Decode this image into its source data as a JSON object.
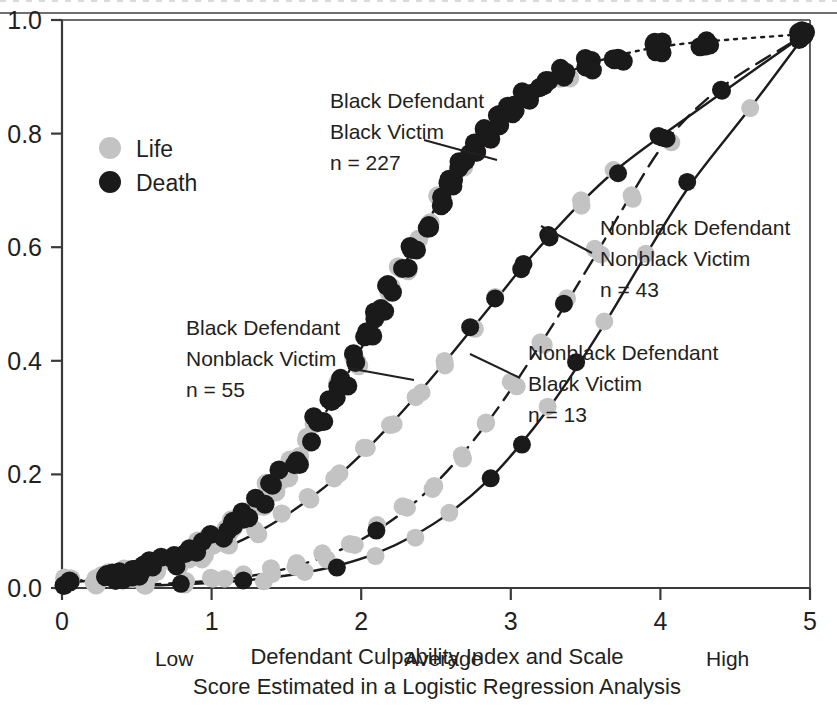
{
  "chart_data": {
    "type": "scatter",
    "title": "",
    "xlabel": "Defendant Culpability Index and Scale Score Estimated in a Logistic Regression Analysis",
    "ylabel": "",
    "xlim": [
      0,
      5
    ],
    "ylim": [
      0,
      1.0
    ],
    "grid": false,
    "x_ticks": [
      "0",
      "1",
      "2",
      "3",
      "4",
      "5"
    ],
    "x_tick_values": [
      0,
      1,
      2,
      3,
      4,
      5
    ],
    "y_ticks": [
      "0.0",
      "0.2",
      "0.4",
      "0.6",
      "0.8",
      "1.0"
    ],
    "y_tick_values": [
      0.0,
      0.2,
      0.4,
      0.6,
      0.8,
      1.0
    ],
    "x_anchor_labels": [
      {
        "label": "Low",
        "at": 0.75
      },
      {
        "label": "Average",
        "at": 2.55
      },
      {
        "label": "High",
        "at": 4.45
      }
    ],
    "legend": {
      "position": "upper-left-inside",
      "entries": [
        {
          "label": "Life",
          "marker": "circle",
          "color": "#c3c3c3"
        },
        {
          "label": "Death",
          "marker": "circle",
          "color": "#1a1a1a"
        }
      ]
    },
    "series": [
      {
        "name": "Black Defendant Black Victim",
        "n": 227,
        "n_label": "n = 227",
        "line_style": "dotted",
        "x": [
          0.05,
          0.22,
          0.3,
          0.38,
          0.45,
          0.52,
          0.6,
          0.68,
          0.76,
          0.84,
          0.92,
          1.0,
          1.08,
          1.16,
          1.24,
          1.32,
          1.4,
          1.48,
          1.56,
          1.64,
          1.72,
          1.8,
          1.88,
          1.96,
          2.04,
          2.12,
          2.2,
          2.28,
          2.36,
          2.44,
          2.52,
          2.6,
          2.68,
          2.76,
          2.84,
          2.92,
          3.0,
          3.1,
          3.22,
          3.36,
          3.52,
          3.72,
          3.98,
          4.3,
          4.95
        ],
        "y": [
          0.012,
          0.016,
          0.019,
          0.023,
          0.027,
          0.031,
          0.037,
          0.044,
          0.052,
          0.061,
          0.072,
          0.084,
          0.098,
          0.114,
          0.132,
          0.152,
          0.175,
          0.2,
          0.228,
          0.258,
          0.291,
          0.326,
          0.363,
          0.402,
          0.442,
          0.483,
          0.524,
          0.565,
          0.605,
          0.643,
          0.68,
          0.714,
          0.746,
          0.775,
          0.801,
          0.824,
          0.845,
          0.866,
          0.886,
          0.905,
          0.922,
          0.938,
          0.952,
          0.962,
          0.975
        ]
      },
      {
        "name": "Black Defendant Nonblack Victim",
        "n": 55,
        "n_label": "n = 55",
        "line_style": "dash-dot",
        "x": [
          0.05,
          0.25,
          0.45,
          0.6,
          0.78,
          0.95,
          1.12,
          1.3,
          1.48,
          1.66,
          1.84,
          2.02,
          2.2,
          2.38,
          2.56,
          2.74,
          2.92,
          3.08,
          3.26,
          3.46,
          3.7,
          4.0,
          4.95
        ],
        "y": [
          0.01,
          0.015,
          0.022,
          0.03,
          0.042,
          0.056,
          0.074,
          0.097,
          0.125,
          0.158,
          0.196,
          0.24,
          0.289,
          0.342,
          0.398,
          0.456,
          0.514,
          0.566,
          0.62,
          0.676,
          0.735,
          0.795,
          0.972
        ]
      },
      {
        "name": "Nonblack Defendant Nonblack Victim",
        "n": 43,
        "n_label": "n = 43",
        "line_style": "dashed",
        "x": [
          0.55,
          0.8,
          1.0,
          1.2,
          1.4,
          1.58,
          1.76,
          1.94,
          2.12,
          2.3,
          2.48,
          2.66,
          2.84,
          3.02,
          3.2,
          3.38,
          3.58,
          3.8,
          4.05,
          4.4,
          4.95
        ],
        "y": [
          0.006,
          0.009,
          0.013,
          0.019,
          0.028,
          0.04,
          0.056,
          0.077,
          0.104,
          0.138,
          0.18,
          0.231,
          0.29,
          0.357,
          0.43,
          0.505,
          0.592,
          0.69,
          0.79,
          0.88,
          0.972
        ]
      },
      {
        "name": "Nonblack Defendant Black Victim",
        "n": 13,
        "n_label": "n = 13",
        "line_style": "solid",
        "x": [
          0.55,
          0.85,
          1.1,
          1.35,
          1.6,
          1.85,
          2.1,
          2.35,
          2.6,
          2.85,
          3.05,
          3.25,
          3.45,
          3.65,
          3.9,
          4.2,
          4.6,
          4.95
        ],
        "y": [
          0.004,
          0.007,
          0.011,
          0.017,
          0.026,
          0.04,
          0.061,
          0.092,
          0.134,
          0.19,
          0.248,
          0.315,
          0.392,
          0.475,
          0.585,
          0.71,
          0.845,
          0.968
        ]
      }
    ],
    "annotations": [
      {
        "id": "black-black",
        "lines": [
          "Black Defendant",
          "Black Victim",
          "n = 227"
        ],
        "text_x": 330,
        "text_y": 108,
        "leader": {
          "x1": 424,
          "y1": 140,
          "x2": 497,
          "y2": 160
        }
      },
      {
        "id": "black-nonblack",
        "lines": [
          "Black Defendant",
          "Nonblack Victim",
          "n = 55"
        ],
        "text_x": 186,
        "text_y": 335,
        "leader": {
          "x1": 348,
          "y1": 368,
          "x2": 414,
          "y2": 380
        }
      },
      {
        "id": "nonblack-nonblack",
        "lines": [
          "Nonblack Defendant",
          "Nonblack Victim",
          "n = 43"
        ],
        "text_x": 600,
        "text_y": 235,
        "leader": {
          "x1": 592,
          "y1": 253,
          "x2": 541,
          "y2": 226
        }
      },
      {
        "id": "nonblack-black",
        "lines": [
          "Nonblack Defendant",
          "Black Victim",
          "n = 13"
        ],
        "text_x": 528,
        "text_y": 360,
        "leader": {
          "x1": 520,
          "y1": 378,
          "x2": 470,
          "y2": 354
        }
      }
    ],
    "caption_lines": [
      "Defendant Culpability Index and Scale",
      "Score Estimated in a Logistic Regression Analysis"
    ],
    "colors": {
      "life_marker": "#c3c3c3",
      "death_marker": "#1a1a1a",
      "axis": "#3a3a3a",
      "text": "#231f20"
    }
  },
  "legend_block": {
    "life": "Life",
    "death": "Death"
  }
}
